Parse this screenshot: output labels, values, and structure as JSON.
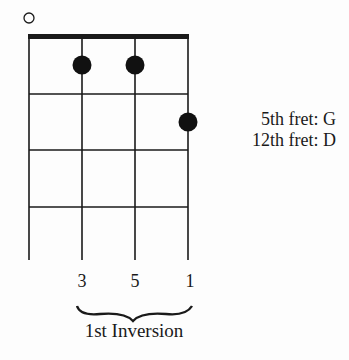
{
  "diagram": {
    "type": "ukulele-chord-diagram",
    "open_string_marker": "open-circle",
    "strings": 4,
    "frets_shown": 4,
    "finger_dots": [
      {
        "string": 2,
        "fret": 1
      },
      {
        "string": 3,
        "fret": 1
      },
      {
        "string": 4,
        "fret": 2
      }
    ],
    "side_notes": {
      "line1": "5th fret: G",
      "line2": "12th fret: D"
    },
    "interval_labels": [
      "3",
      "5",
      "1"
    ],
    "caption": "1st Inversion",
    "colors": {
      "ink": "#1a1a1a",
      "background": "#fdfdfd"
    }
  }
}
